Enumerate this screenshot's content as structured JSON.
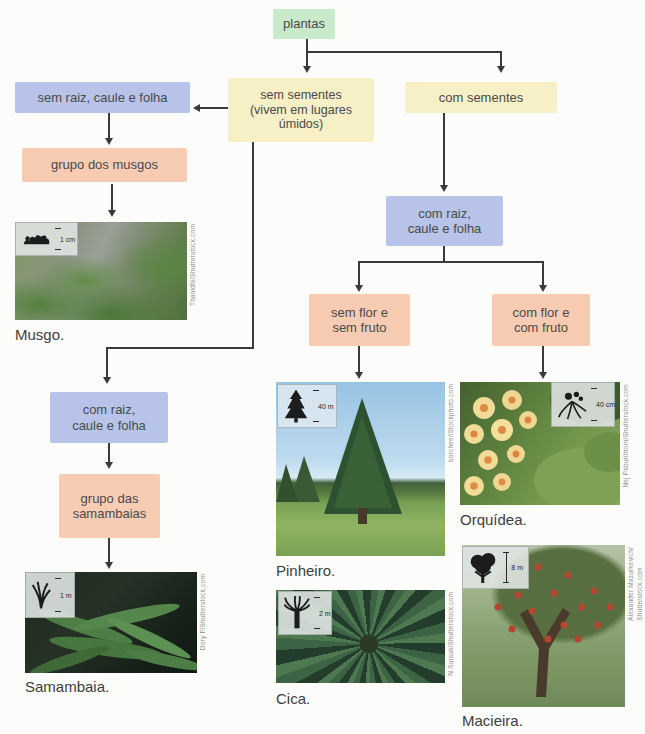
{
  "diagram_title": "Classificação das plantas (fluxograma)",
  "nodes": {
    "plantas": "plantas",
    "sem_raiz": "sem raiz, caule e folha",
    "sem_sementes": "sem sementes\n(vivem em lugares\númidos)",
    "com_sementes": "com sementes",
    "grupo_musgos": "grupo dos musgos",
    "com_raiz_right": "com raiz,\ncaule e folha",
    "sem_flor": "sem flor e\nsem fruto",
    "com_flor": "com flor e\ncom fruto",
    "com_raiz_left": "com raiz,\ncaule e folha",
    "grupo_samambaias": "grupo das\nsamambaias"
  },
  "photos": {
    "musgo": {
      "caption": "Musgo.",
      "scale": "1 cm",
      "credit": "Thanidhi/Shutterstock.com"
    },
    "samambaia": {
      "caption": "Samambaia.",
      "scale": "1 m",
      "credit": "Dory F/Shutterstock.com"
    },
    "pinheiro": {
      "caption": "Pinheiro.",
      "scale": "40 m",
      "credit": "borchee/iStockphoto.com"
    },
    "cica": {
      "caption": "Cica.",
      "scale": "2 m",
      "credit": "N.Sursuk/Shutterstock.com"
    },
    "orquidea": {
      "caption": "Orquídea.",
      "scale": "40 cm",
      "credit": "Nej Paburithorn/Shutterstock.com"
    },
    "macieira": {
      "caption": "Macieira.",
      "scale": "8 m",
      "credit": "Alexander Mazurkevich/\nShutterstock.com"
    }
  },
  "colors": {
    "root_box_green": "#c8eac9",
    "attribute_box_blue": "#b7c3e8",
    "seed_box_yellow": "#f7f0c6",
    "group_box_pink": "#f8cbb3",
    "connector": "#3a3a3a",
    "node_text": "#4a4a4a",
    "caption_text": "#3e3e3e"
  }
}
